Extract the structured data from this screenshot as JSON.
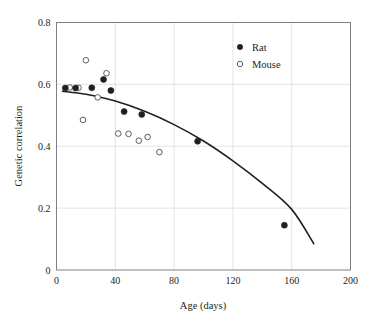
{
  "chart_data": {
    "type": "scatter",
    "title": "",
    "xlabel": "Age (days)",
    "ylabel": "Genetic correlation",
    "xlim": [
      0,
      200
    ],
    "ylim": [
      0,
      0.8
    ],
    "xticks": [
      0,
      40,
      80,
      120,
      160,
      200
    ],
    "yticks": [
      0,
      0.2,
      0.4,
      0.6,
      0.8
    ],
    "xtick_labels": [
      "0",
      "40",
      "80",
      "120",
      "160",
      "200"
    ],
    "ytick_labels": [
      "0",
      "0.2",
      "0.4",
      "0.6",
      "0.8"
    ],
    "grid": true,
    "grid_axis": "both",
    "legend_position": "top-right",
    "series": [
      {
        "name": "Rat",
        "marker": "filled-circle",
        "color": "#231f20",
        "points": [
          {
            "x": 6,
            "y": 0.588
          },
          {
            "x": 13,
            "y": 0.588
          },
          {
            "x": 24,
            "y": 0.589
          },
          {
            "x": 32,
            "y": 0.616
          },
          {
            "x": 37,
            "y": 0.58
          },
          {
            "x": 46,
            "y": 0.512
          },
          {
            "x": 58,
            "y": 0.503
          },
          {
            "x": 96,
            "y": 0.416
          },
          {
            "x": 155,
            "y": 0.145
          }
        ]
      },
      {
        "name": "Mouse",
        "marker": "open-circle",
        "color": "#4d4d4d",
        "points": [
          {
            "x": 9,
            "y": 0.59
          },
          {
            "x": 15,
            "y": 0.589
          },
          {
            "x": 18,
            "y": 0.485
          },
          {
            "x": 20,
            "y": 0.678
          },
          {
            "x": 28,
            "y": 0.558
          },
          {
            "x": 34,
            "y": 0.636
          },
          {
            "x": 42,
            "y": 0.441
          },
          {
            "x": 49,
            "y": 0.44
          },
          {
            "x": 56,
            "y": 0.418
          },
          {
            "x": 62,
            "y": 0.43
          },
          {
            "x": 70,
            "y": 0.381
          }
        ]
      }
    ],
    "fit_curve": {
      "name": "fitted-trend",
      "color": "#231f20",
      "x_start": 4,
      "x_end": 175,
      "points": [
        {
          "x": 4,
          "y": 0.578
        },
        {
          "x": 20,
          "y": 0.568
        },
        {
          "x": 40,
          "y": 0.546
        },
        {
          "x": 60,
          "y": 0.513
        },
        {
          "x": 80,
          "y": 0.47
        },
        {
          "x": 100,
          "y": 0.417
        },
        {
          "x": 120,
          "y": 0.353
        },
        {
          "x": 140,
          "y": 0.28
        },
        {
          "x": 160,
          "y": 0.196
        },
        {
          "x": 175,
          "y": 0.085
        }
      ]
    }
  },
  "legend": {
    "entries": [
      {
        "label": "Rat",
        "marker": "filled-circle"
      },
      {
        "label": "Mouse",
        "marker": "open-circle"
      }
    ]
  }
}
